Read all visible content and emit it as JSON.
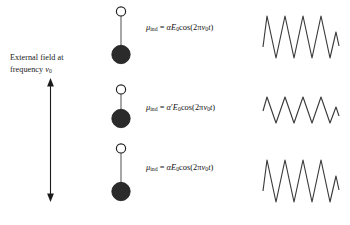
{
  "figure": {
    "type": "schematic-diagram",
    "topic": "Induced dipole moment of a vibrating molecule in an oscillating external field",
    "background_color": "#ffffff",
    "ink_color": "#1a1a1a"
  },
  "left_panel": {
    "caption_line_1": "External field at",
    "caption_line_2_prefix": "frequency ",
    "caption_line_2_symbol": "ν",
    "caption_line_2_subscript": "0",
    "arrow": {
      "name": "double-headed-vertical-arrow",
      "direction": "up-down",
      "top_y": 78,
      "bottom_y": 202
    }
  },
  "rows": [
    {
      "index": 0,
      "label": "equilibrium-bond-length",
      "molecule": {
        "open_atom_radius": 4.6,
        "filled_atom_radius": 9.2,
        "bond_length": 36,
        "open_atom_fill": "#ffffff",
        "filled_atom_fill": "#2b2b2b"
      },
      "equation": {
        "mu": "μ",
        "mu_subscript": "ind",
        "equals": " = ",
        "alpha": "α",
        "alpha_prime": "",
        "field": "E",
        "field_subscript": "0",
        "cosine": "cos(2π",
        "nu": "ν",
        "nu_subscript": "0",
        "time": "t",
        "close": ")",
        "plain_text": "μ_ind = αE₀cos(2πν₀t)"
      },
      "waveform": {
        "name": "scattered-field-wave-large",
        "cycles": 4,
        "amplitude": 24,
        "relative_amplitude": 1.0
      }
    },
    {
      "index": 1,
      "label": "compressed-bond-length",
      "molecule": {
        "open_atom_radius": 4.6,
        "filled_atom_radius": 9.2,
        "bond_length": 20,
        "open_atom_fill": "#ffffff",
        "filled_atom_fill": "#2b2b2b"
      },
      "equation": {
        "mu": "μ",
        "mu_subscript": "ind",
        "equals": " = ",
        "alpha": "α",
        "alpha_prime": "′",
        "field": "E",
        "field_subscript": "0",
        "cosine": "cos(2π",
        "nu": "ν",
        "nu_subscript": "0",
        "time": "t",
        "close": ")",
        "plain_text": "μ_ind = α′E₀cos(2πν₀t)"
      },
      "waveform": {
        "name": "scattered-field-wave-small",
        "cycles": 4,
        "amplitude": 13,
        "relative_amplitude": 0.54
      }
    },
    {
      "index": 2,
      "label": "equilibrium-bond-length-return",
      "molecule": {
        "open_atom_radius": 4.6,
        "filled_atom_radius": 9.2,
        "bond_length": 36,
        "open_atom_fill": "#ffffff",
        "filled_atom_fill": "#2b2b2b"
      },
      "equation": {
        "mu": "μ",
        "mu_subscript": "ind",
        "equals": " = ",
        "alpha": "α",
        "alpha_prime": "",
        "field": "E",
        "field_subscript": "0",
        "cosine": "cos(2π",
        "nu": "ν",
        "nu_subscript": "0",
        "time": "t",
        "close": ")",
        "plain_text": "μ_ind = αE₀cos(2πν₀t)"
      },
      "waveform": {
        "name": "scattered-field-wave-large",
        "cycles": 4,
        "amplitude": 24,
        "relative_amplitude": 1.0
      }
    }
  ]
}
